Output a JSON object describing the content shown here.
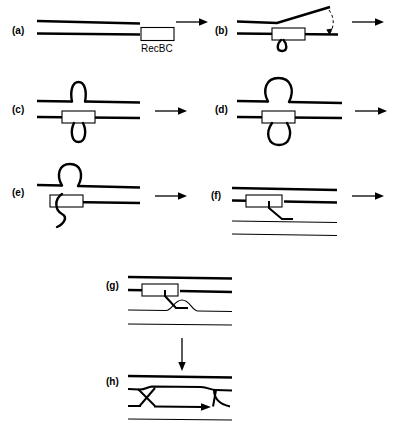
{
  "figure": {
    "background_color": "#ffffff",
    "line_color": "#000000",
    "width": 394,
    "height": 426
  },
  "panels": [
    {
      "id": "a",
      "label": "(a)",
      "caption": "Linear duplex DNA with RecBC enzyme bound at the blunt end",
      "enzyme_label": "RecBC",
      "has_enzyme_box": true,
      "has_loops": false
    },
    {
      "id": "b",
      "label": "(b)",
      "caption": "RecBC begins unwinding; top strand peels upward",
      "has_enzyme_box": true,
      "has_loops": false,
      "has_motion_arrow": true
    },
    {
      "id": "c",
      "label": "(c)",
      "caption": "Twin single-strand loops form above and below the enzyme",
      "has_enzyme_box": true,
      "has_loops": true
    },
    {
      "id": "d",
      "label": "(d)",
      "caption": "Loops enlarge as translocation continues",
      "has_enzyme_box": true,
      "has_loops": true
    },
    {
      "id": "e",
      "label": "(e)",
      "caption": "Nicking at chi releases the lower loop as a free 3' tail",
      "has_enzyme_box": true,
      "has_loops": true
    },
    {
      "id": "f",
      "label": "(f)",
      "caption": "Free 3' single-strand tail approaches a homologous duplex",
      "has_enzyme_box": true,
      "has_loops": false
    },
    {
      "id": "g",
      "label": "(g)",
      "caption": "Strand invasion forms a displacement loop (D-loop)",
      "has_enzyme_box": true,
      "has_loops": false
    },
    {
      "id": "h",
      "label": "(h)",
      "caption": "Crossover joint molecule with branch migration",
      "has_enzyme_box": false,
      "has_loops": false,
      "has_branch_arrow": true
    }
  ],
  "connectors": [
    {
      "id": "a-to-b",
      "type": "arrow",
      "direction": "right"
    },
    {
      "id": "b-to-c",
      "type": "arrow",
      "direction": "right"
    },
    {
      "id": "c-to-d",
      "type": "arrow",
      "direction": "right"
    },
    {
      "id": "d-to-e",
      "type": "arrow",
      "direction": "right"
    },
    {
      "id": "e-to-f",
      "type": "arrow",
      "direction": "right"
    },
    {
      "id": "f-to-g",
      "type": "arrow",
      "direction": "right"
    },
    {
      "id": "g-to-h",
      "type": "arrow",
      "direction": "down"
    }
  ]
}
